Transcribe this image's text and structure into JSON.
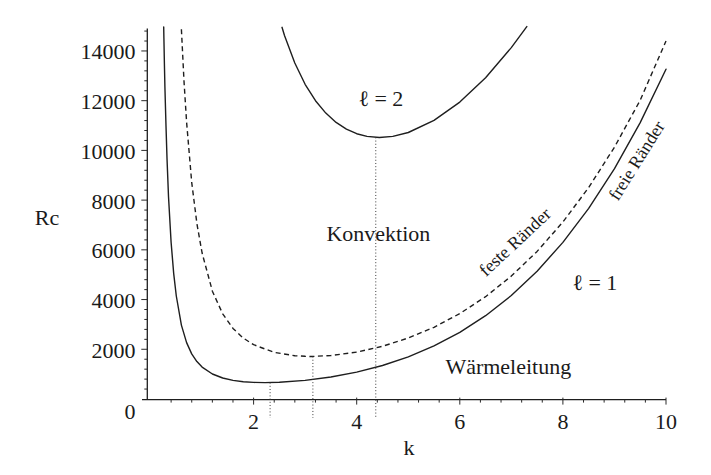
{
  "chart_data": {
    "type": "line",
    "title": "",
    "xlabel": "k",
    "ylabel": "Rc",
    "xlim": [
      0,
      10
    ],
    "ylim": [
      0,
      14900
    ],
    "grid": false,
    "legend": null,
    "x_ticks": [
      2,
      4,
      6,
      8,
      10
    ],
    "x_tick_labels": [
      "2",
      "4",
      "6",
      "8",
      "10"
    ],
    "x_minor_step": 0.4,
    "y_ticks": [
      0,
      2000,
      4000,
      6000,
      8000,
      10000,
      12000,
      14000
    ],
    "y_tick_labels": [
      "0",
      "2000",
      "4000",
      "6000",
      "8000",
      "10000",
      "12000",
      "14000"
    ],
    "y_minor_step": 400,
    "series": [
      {
        "name": "ℓ = 1, freie Ränder",
        "style": "solid",
        "points": [
          [
            0.256,
            14964
          ],
          [
            0.26,
            14516
          ],
          [
            0.27,
            13482
          ],
          [
            0.28,
            12557
          ],
          [
            0.3,
            10977
          ],
          [
            0.32,
            9684
          ],
          [
            0.35,
            8144
          ],
          [
            0.4,
            6306
          ],
          [
            0.45,
            5046
          ],
          [
            0.5,
            4145
          ],
          [
            0.6,
            2974
          ],
          [
            0.7,
            2269
          ],
          [
            0.8,
            1814
          ],
          [
            0.9,
            1504
          ],
          [
            1.0,
            1284
          ],
          [
            1.2,
            1005
          ],
          [
            1.4,
            845
          ],
          [
            1.6,
            750
          ],
          [
            1.8,
            695
          ],
          [
            2.0,
            667
          ],
          [
            2.22,
            658
          ],
          [
            2.5,
            670
          ],
          [
            3.0,
            747
          ],
          [
            3.5,
            884
          ],
          [
            4.0,
            1082
          ],
          [
            4.5,
            1349
          ],
          [
            5.0,
            1696
          ],
          [
            5.5,
            2135
          ],
          [
            6.0,
            2681
          ],
          [
            6.5,
            3351
          ],
          [
            7.0,
            4164
          ],
          [
            7.5,
            5139
          ],
          [
            8.0,
            6298
          ],
          [
            8.5,
            7665
          ],
          [
            9.0,
            9263
          ],
          [
            9.5,
            11120
          ],
          [
            10.0,
            13268
          ]
        ]
      },
      {
        "name": "ℓ = 1, feste Ränder",
        "style": "dashed",
        "points": [
          [
            0.6,
            14870
          ],
          [
            0.65,
            12787
          ],
          [
            0.7,
            11133
          ],
          [
            0.8,
            8716
          ],
          [
            0.9,
            7056
          ],
          [
            1.0,
            5872
          ],
          [
            1.2,
            4338
          ],
          [
            1.4,
            3422
          ],
          [
            1.6,
            2839
          ],
          [
            1.8,
            2451
          ],
          [
            2.0,
            2185
          ],
          [
            2.4,
            1875
          ],
          [
            2.8,
            1742
          ],
          [
            3.0,
            1718
          ],
          [
            3.12,
            1708
          ],
          [
            3.2,
            1717
          ],
          [
            3.5,
            1750
          ],
          [
            4.0,
            1888
          ],
          [
            4.5,
            2121
          ],
          [
            5.0,
            2452
          ],
          [
            5.5,
            2886
          ],
          [
            6.0,
            3436
          ],
          [
            6.5,
            4116
          ],
          [
            7.0,
            4944
          ],
          [
            7.5,
            5938
          ],
          [
            8.0,
            7118
          ],
          [
            8.5,
            8509
          ],
          [
            9.0,
            10133
          ],
          [
            9.5,
            12018
          ],
          [
            10.0,
            14400
          ]
        ]
      },
      {
        "name": "ℓ = 2, freie Ränder",
        "style": "solid",
        "points": [
          [
            2.55,
            14950
          ],
          [
            2.6,
            14623
          ],
          [
            2.8,
            13514
          ],
          [
            3.0,
            12658
          ],
          [
            3.2,
            12001
          ],
          [
            3.4,
            11501
          ],
          [
            3.6,
            11126
          ],
          [
            3.8,
            10855
          ],
          [
            4.0,
            10672
          ],
          [
            4.2,
            10564
          ],
          [
            4.44,
            10520
          ],
          [
            4.7,
            10565
          ],
          [
            5.0,
            10722
          ],
          [
            5.5,
            11207
          ],
          [
            6.0,
            11944
          ],
          [
            6.5,
            12920
          ],
          [
            7.0,
            14135
          ],
          [
            7.3,
            14981
          ]
        ]
      }
    ],
    "critical_points": [
      {
        "k": 2.32,
        "Rc": 659
      },
      {
        "k": 3.15,
        "Rc": 1708
      },
      {
        "k": 4.37,
        "Rc": 10524
      }
    ],
    "annotations": [
      {
        "text": "ℓ = 2",
        "k": 4.47,
        "R": 12100,
        "rotation": 0
      },
      {
        "text": "Konvektion",
        "k": 4.42,
        "R": 6670,
        "rotation": 0
      },
      {
        "text": "Wärmeleitung",
        "k": 6.94,
        "R": 1290,
        "rotation": 0
      },
      {
        "text": "ℓ = 1",
        "k": 8.62,
        "R": 4670,
        "rotation": 0
      },
      {
        "text": "feste Ränder",
        "k": 7.07,
        "R": 6320,
        "rotation": -43
      },
      {
        "text": "freie Ränder",
        "k": 9.43,
        "R": 9590,
        "rotation": -58
      }
    ]
  }
}
